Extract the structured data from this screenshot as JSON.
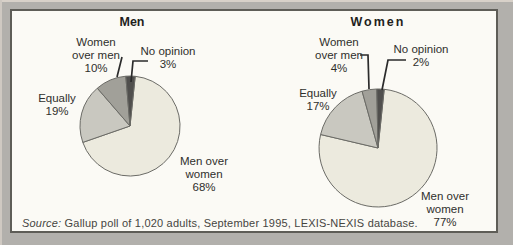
{
  "palette": {
    "outer_background": "#b2b0ac",
    "panel_background": "#fbfaf5",
    "panel_border": "#5e5d57",
    "slice_stroke": "#6b6b66",
    "callout_line": "#2b2b2b",
    "text": "#2f2f2c"
  },
  "source_note": {
    "label": "Source:",
    "text": " Gallup poll of 1,020 adults, September 1995, LEXIS-NEXIS database."
  },
  "chart_data": [
    {
      "type": "pie",
      "title": "Men",
      "unit": "%",
      "total": 100,
      "start_angle_deg": 6,
      "labels_include_percent": true,
      "slices": [
        {
          "label": "Men over women",
          "value": 68,
          "display": [
            "Men over",
            "women",
            "68%"
          ],
          "color": "#eceade"
        },
        {
          "label": "Equally",
          "value": 19,
          "display": [
            "Equally",
            "19%"
          ],
          "color": "#c9c8c0"
        },
        {
          "label": "Women over men",
          "value": 10,
          "display": [
            "Women",
            "over men",
            "10%"
          ],
          "color": "#a1a099"
        },
        {
          "label": "No opinion",
          "value": 3,
          "display": [
            "No opinion",
            "3%"
          ],
          "color": "#504f4d"
        }
      ]
    },
    {
      "type": "pie",
      "title": "Women",
      "unit": "%",
      "total": 100,
      "start_angle_deg": 6,
      "labels_include_percent": true,
      "slices": [
        {
          "label": "Men over women",
          "value": 77,
          "display": [
            "Men over",
            "women",
            "77%"
          ],
          "color": "#eceade"
        },
        {
          "label": "Equally",
          "value": 17,
          "display": [
            "Equally",
            "17%"
          ],
          "color": "#c9c8c0"
        },
        {
          "label": "Women over men",
          "value": 4,
          "display": [
            "Women",
            "over men",
            "4%"
          ],
          "color": "#a1a099"
        },
        {
          "label": "No opinion",
          "value": 2,
          "display": [
            "No opinion",
            "2%"
          ],
          "color": "#504f4d"
        }
      ]
    }
  ]
}
